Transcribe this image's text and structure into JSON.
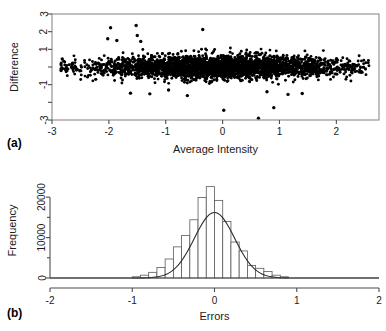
{
  "figure": {
    "panel_a_tag": "(a)",
    "panel_b_tag": "(b)"
  },
  "chart_data": [
    {
      "type": "scatter",
      "panel": "(a)",
      "title": "",
      "xlabel": "Average Intensity",
      "ylabel": "Difference",
      "xlim": [
        -3,
        2.75
      ],
      "ylim": [
        -3,
        3
      ],
      "xticks": [
        -3,
        -2,
        -1,
        0,
        1,
        2
      ],
      "xticklabels": [
        "-3",
        "-2",
        "-1",
        "0",
        "1",
        "2"
      ],
      "yticks": [
        -3,
        -2,
        -1,
        0,
        1,
        2,
        3
      ],
      "yticklabels": [
        "-3",
        "",
        "-1",
        "",
        "1",
        "2",
        "3"
      ],
      "grid": false,
      "legend": false,
      "frame": "box",
      "n_points": 3000,
      "description": "Dense black point cloud centred on Difference = 0, spanning Average Intensity from about -2.85 to 2.6; vertical spread roughly -1 to 1 with scattered outliers reaching +2.4 and -2.8.",
      "cloud": {
        "x_center": -0.05,
        "x_spread": 1.15,
        "x_min": -2.85,
        "x_max": 2.6,
        "y_center": 0.0,
        "y_sigma": 0.33
      },
      "outliers": [
        {
          "x": -2.82,
          "y": 0.45
        },
        {
          "x": -2.84,
          "y": -0.1
        },
        {
          "x": -2.84,
          "y": -0.2
        },
        {
          "x": -1.97,
          "y": 2.22
        },
        {
          "x": -2.02,
          "y": 1.6
        },
        {
          "x": -1.86,
          "y": 1.5
        },
        {
          "x": -1.52,
          "y": 2.35
        },
        {
          "x": -1.5,
          "y": 1.78
        },
        {
          "x": -1.44,
          "y": 1.45
        },
        {
          "x": -0.35,
          "y": 2.12
        },
        {
          "x": -1.62,
          "y": -1.48
        },
        {
          "x": -1.28,
          "y": -1.52
        },
        {
          "x": -0.62,
          "y": -1.62
        },
        {
          "x": 0.02,
          "y": -2.45
        },
        {
          "x": 0.63,
          "y": -2.9
        },
        {
          "x": 0.9,
          "y": -2.3
        },
        {
          "x": 1.15,
          "y": -1.55
        },
        {
          "x": 1.4,
          "y": -1.5
        },
        {
          "x": -0.95,
          "y": -1.3
        },
        {
          "x": 0.78,
          "y": -1.4
        }
      ]
    },
    {
      "type": "bar",
      "panel": "(b)",
      "title": "",
      "xlabel": "Errors",
      "ylabel": "Frequency",
      "xlim": [
        -2,
        2
      ],
      "ylim": [
        0,
        23500
      ],
      "xticks": [
        -2,
        -1,
        0,
        1,
        2
      ],
      "xticklabels": [
        "-2",
        "-1",
        "0",
        "1",
        "2"
      ],
      "yticks": [
        0,
        10000,
        20000
      ],
      "yticklabels": [
        "0",
        "10000",
        "20000"
      ],
      "yminorticks": [
        5000,
        15000
      ],
      "grid": false,
      "legend": false,
      "bin_width": 0.1,
      "bin_centers": [
        -0.95,
        -0.85,
        -0.75,
        -0.65,
        -0.55,
        -0.45,
        -0.35,
        -0.25,
        -0.15,
        -0.05,
        0.05,
        0.15,
        0.25,
        0.35,
        0.45,
        0.55,
        0.65,
        0.75,
        0.85
      ],
      "categories": [
        "-0.95",
        "-0.85",
        "-0.75",
        "-0.65",
        "-0.55",
        "-0.45",
        "-0.35",
        "-0.25",
        "-0.15",
        "-0.05",
        "0.05",
        "0.15",
        "0.25",
        "0.35",
        "0.45",
        "0.55",
        "0.65",
        "0.75",
        "0.85"
      ],
      "values": [
        300,
        700,
        1400,
        2600,
        4700,
        7700,
        10500,
        14400,
        19900,
        22600,
        19200,
        14000,
        8900,
        6700,
        3100,
        2400,
        1600,
        700,
        300
      ],
      "overlay": {
        "type": "line",
        "name": "normal density curve",
        "peak_value": 16200,
        "mean": 0.0,
        "sigma": 0.245
      }
    }
  ]
}
